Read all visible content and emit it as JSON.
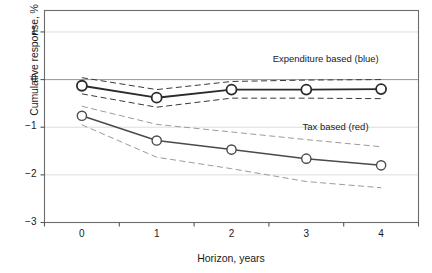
{
  "chart_data": {
    "type": "line",
    "title": "",
    "subtitle": "",
    "xlabel": "Horizon, years",
    "ylabel": "Cumulative response, %",
    "x": [
      0,
      1,
      2,
      3,
      4
    ],
    "categories": [
      "0",
      "1",
      "2",
      "3",
      "4"
    ],
    "xtick_labels": [
      "0",
      "1",
      "2",
      "3",
      "4"
    ],
    "ytick_labels": [
      "1",
      "0",
      "−1",
      "−2",
      "−3"
    ],
    "ytick_values": [
      1,
      0,
      -1,
      -2,
      -3
    ],
    "xlim": [
      -0.5,
      4.5
    ],
    "ylim": [
      -3,
      1.45
    ],
    "grid": "horizontal-light",
    "legend_position": "inline-annotations",
    "series": [
      {
        "name": "Expenditure based (blue)",
        "label_text": "Expenditure based (blue)",
        "marker": "open-circle",
        "line_style": "solid",
        "color": "#2b2b2b",
        "values": [
          -0.13,
          -0.38,
          -0.21,
          -0.21,
          -0.2
        ],
        "ci_upper": [
          0.04,
          -0.21,
          -0.04,
          -0.01,
          0.0
        ],
        "ci_lower": [
          -0.3,
          -0.58,
          -0.39,
          -0.39,
          -0.4
        ],
        "ci_style": "dashed"
      },
      {
        "name": "Tax based (red)",
        "label_text": "Tax based (red)",
        "marker": "open-circle",
        "line_style": "solid",
        "color": "#4a4a4a",
        "values": [
          -0.76,
          -1.28,
          -1.47,
          -1.66,
          -1.8
        ],
        "ci_upper": [
          -0.56,
          -0.94,
          -1.1,
          -1.26,
          -1.41
        ],
        "ci_lower": [
          -0.95,
          -1.63,
          -1.87,
          -2.14,
          -2.27
        ],
        "ci_style": "dashed"
      }
    ],
    "annotations": [
      {
        "text": "Expenditure based (blue)",
        "x": 2.55,
        "y": 0.42
      },
      {
        "text": "Tax based (red)",
        "x": 2.95,
        "y": -1.02
      }
    ]
  },
  "axis": {
    "y_label": "Cumulative response, %",
    "x_label": "Horizon, years"
  }
}
